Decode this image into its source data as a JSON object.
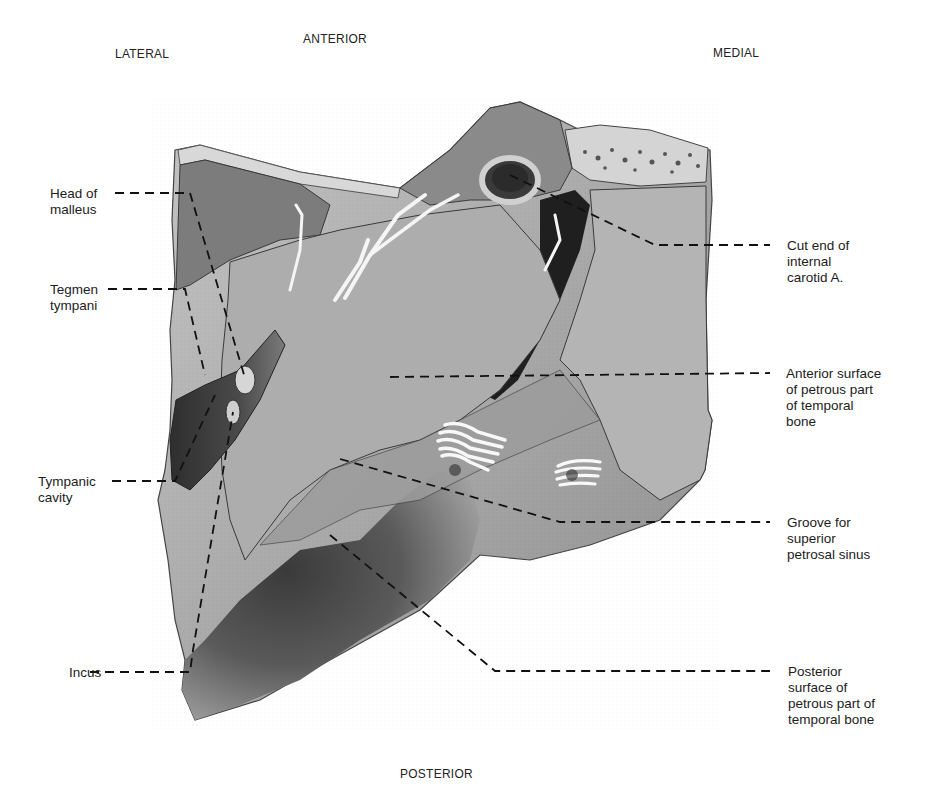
{
  "orientation": {
    "top": "ANTERIOR",
    "left": "LATERAL",
    "right": "MEDIAL",
    "bottom": "POSTERIOR"
  },
  "labels_left": [
    {
      "id": "head-of-malleus",
      "text": "Head of\nmalleus"
    },
    {
      "id": "tegmen-tympani",
      "text": "Tegmen\ntympani"
    },
    {
      "id": "tympanic-cavity",
      "text": "Tympanic\ncavity"
    },
    {
      "id": "incus",
      "text": "Incus"
    }
  ],
  "labels_right": [
    {
      "id": "cut-end-internal-carotid",
      "text": "Cut end of\ninternal\ncarotid A."
    },
    {
      "id": "anterior-surface-petrous",
      "text": "Anterior surface\nof petrous part\nof temporal\nbone"
    },
    {
      "id": "groove-superior-petrosal-sinus",
      "text": "Groove for\nsuperior\npetrosal sinus"
    },
    {
      "id": "posterior-surface-petrous",
      "text": "Posterior\nsurface of\npetrous part of\ntemporal bone"
    }
  ],
  "colors": {
    "bone_light": "#b9b9b9",
    "bone_mid": "#9a9a9a",
    "bone_dark": "#5e5e5e",
    "shadow": "#2a2a2a",
    "nerve": "#f4f4f4",
    "leader": "#111111"
  }
}
